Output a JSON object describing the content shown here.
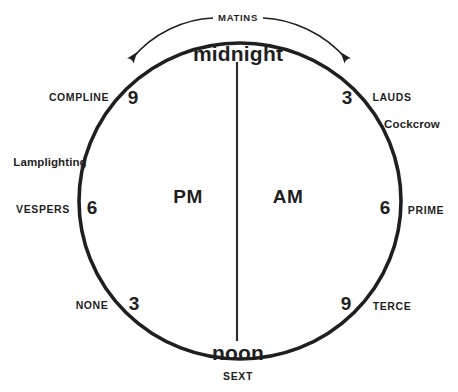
{
  "diagram": {
    "stroke_color": "#1f1f1f",
    "text_color": "#1f1f1f",
    "background_color": "#ffffff",
    "poles": {
      "top": "midnight",
      "bottom": "noon"
    },
    "halves": {
      "left": "PM",
      "right": "AM"
    },
    "arc_label": "MATINS",
    "bottom_label": "SEXT",
    "hours": [
      {
        "numeral": "9",
        "position": "upper-left"
      },
      {
        "numeral": "3",
        "position": "upper-right"
      },
      {
        "numeral": "6",
        "position": "left"
      },
      {
        "numeral": "6",
        "position": "right"
      },
      {
        "numeral": "3",
        "position": "lower-left"
      },
      {
        "numeral": "9",
        "position": "lower-right"
      }
    ],
    "offices": [
      {
        "name": "COMPLINE",
        "side": "left",
        "style": "caps"
      },
      {
        "name": "Lamplighting",
        "side": "left",
        "style": "mixed"
      },
      {
        "name": "VESPERS",
        "side": "left",
        "style": "caps"
      },
      {
        "name": "NONE",
        "side": "left",
        "style": "caps"
      },
      {
        "name": "LAUDS",
        "side": "right",
        "style": "caps"
      },
      {
        "name": "Cockcrow",
        "side": "right",
        "style": "mixed"
      },
      {
        "name": "PRIME",
        "side": "right",
        "style": "caps"
      },
      {
        "name": "TERCE",
        "side": "right",
        "style": "caps"
      },
      {
        "name": "SEXT",
        "side": "bottom",
        "style": "caps"
      },
      {
        "name": "MATINS",
        "side": "top",
        "style": "caps"
      }
    ]
  }
}
